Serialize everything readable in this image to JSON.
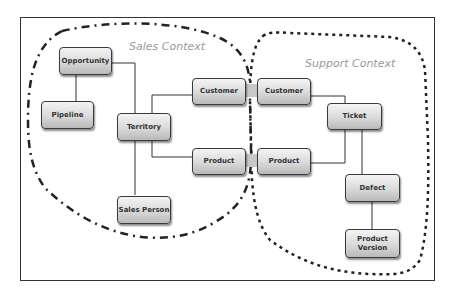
{
  "diagram": {
    "contexts": [
      {
        "id": "sales",
        "label": "Sales Context",
        "border_style": "dash-dot"
      },
      {
        "id": "support",
        "label": "Support Context",
        "border_style": "dotted"
      }
    ],
    "nodes": {
      "opportunity": "Opportunity",
      "pipeline": "Pipeline",
      "territory": "Territory",
      "sales_customer": "Customer",
      "sales_product": "Product",
      "sales_person": "Sales Person",
      "support_customer": "Customer",
      "support_product": "Product",
      "ticket": "Ticket",
      "defect": "Defect",
      "product_version": "Product Version"
    },
    "edges": [
      [
        "Opportunity",
        "Pipeline"
      ],
      [
        "Opportunity",
        "Territory"
      ],
      [
        "Territory",
        "Customer (Sales)"
      ],
      [
        "Territory",
        "Product (Sales)"
      ],
      [
        "Territory",
        "Sales Person"
      ],
      [
        "Customer (Sales)",
        "Customer (Support)"
      ],
      [
        "Product (Sales)",
        "Product (Support)"
      ],
      [
        "Customer (Support)",
        "Ticket"
      ],
      [
        "Product (Support)",
        "Ticket"
      ],
      [
        "Ticket",
        "Defect"
      ],
      [
        "Defect",
        "Product Version"
      ]
    ],
    "colors": {
      "node_fill_top": "#f4f4f4",
      "node_fill_bottom": "#b9b9b9",
      "node_border": "#3a3a3a",
      "context_label": "#9a9a9a",
      "line": "#333333"
    }
  }
}
